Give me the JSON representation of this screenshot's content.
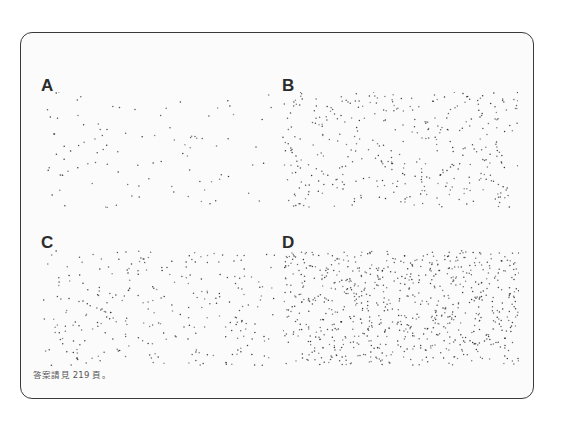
{
  "figure": {
    "panels": [
      {
        "id": "A",
        "label": "A",
        "dot_count": 100,
        "seed": 11,
        "label_pos": [
          41,
          77
        ],
        "area": [
          43,
          92,
          230,
          116
        ]
      },
      {
        "id": "B",
        "label": "B",
        "dot_count": 380,
        "seed": 23,
        "label_pos": [
          282,
          77
        ],
        "area": [
          282,
          92,
          236,
          116
        ]
      },
      {
        "id": "C",
        "label": "C",
        "dot_count": 280,
        "seed": 37,
        "label_pos": [
          41,
          234
        ],
        "area": [
          43,
          250,
          232,
          116
        ]
      },
      {
        "id": "D",
        "label": "D",
        "dot_count": 760,
        "seed": 53,
        "label_pos": [
          282,
          234
        ],
        "area": [
          283,
          250,
          236,
          116
        ]
      }
    ],
    "dot_color": "#333333"
  },
  "footer": {
    "note": "答案請見 219 頁。"
  }
}
